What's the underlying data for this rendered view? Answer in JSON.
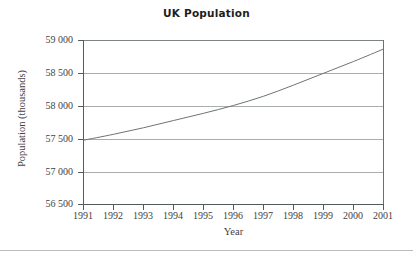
{
  "chart_data": {
    "type": "line",
    "title": "UK Population",
    "xlabel": "Year",
    "ylabel": "Population (thousands)",
    "x": [
      1991,
      1992,
      1993,
      1994,
      1995,
      1996,
      1997,
      1998,
      1999,
      2000,
      2001
    ],
    "categories": [
      "1991",
      "1992",
      "1993",
      "1994",
      "1995",
      "1996",
      "1997",
      "1998",
      "1999",
      "2000",
      "2001"
    ],
    "values": [
      57480,
      57570,
      57670,
      57780,
      57890,
      58010,
      58150,
      58320,
      58500,
      58680,
      58870
    ],
    "series": [
      {
        "name": "UK Population",
        "values": [
          57480,
          57570,
          57670,
          57780,
          57890,
          58010,
          58150,
          58320,
          58500,
          58680,
          58870
        ]
      }
    ],
    "xlim": [
      1991,
      2001
    ],
    "ylim": [
      56500,
      59000
    ],
    "ytick_values": [
      56500,
      57000,
      57500,
      58000,
      58500,
      59000
    ],
    "ytick_labels": [
      "56 500",
      "57 000",
      "57 500",
      "58 000",
      "58 500",
      "59 000"
    ],
    "xtick_labels": [
      "1991",
      "1992",
      "1993",
      "1994",
      "1995",
      "1996",
      "1997",
      "1998",
      "1999",
      "2000",
      "2001"
    ],
    "grid": "horizontal",
    "legend": "none",
    "line_color": "#6e7375",
    "grid_color": "#a9adae",
    "axis_color": "#555a5c",
    "text_color": "#3f4243",
    "background": "#ffffff"
  }
}
